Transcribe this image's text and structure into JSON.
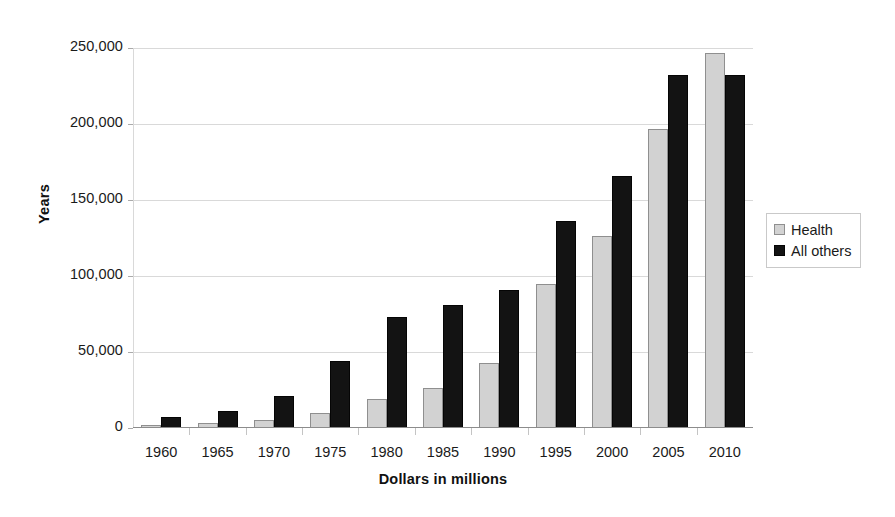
{
  "chart_data": {
    "type": "bar",
    "title": "",
    "xlabel": "Dollars in millions",
    "ylabel": "Years",
    "categories": [
      "1960",
      "1965",
      "1970",
      "1975",
      "1980",
      "1985",
      "1990",
      "1995",
      "2000",
      "2005",
      "2010"
    ],
    "series": [
      {
        "name": "Health",
        "color": "#d2d2d2",
        "values": [
          2000,
          3000,
          5000,
          10000,
          19000,
          26000,
          43000,
          95000,
          126000,
          197000,
          247000
        ]
      },
      {
        "name": "All others",
        "color": "#131313",
        "values": [
          7000,
          11000,
          21000,
          44000,
          73000,
          81000,
          91000,
          136000,
          166000,
          232000,
          232000
        ]
      }
    ],
    "ylim": [
      0,
      250000
    ],
    "ytick_values": [
      0,
      50000,
      100000,
      150000,
      200000,
      250000
    ],
    "ytick_labels": [
      "0",
      "50,000",
      "100,000",
      "150,000",
      "200,000",
      "250,000"
    ],
    "grid": true,
    "legend_position": "right"
  },
  "axes": {
    "y_title": "Years",
    "x_title": "Dollars in millions"
  },
  "legend": {
    "entries": [
      {
        "label": "Health",
        "swatch": "legend-swatch-health"
      },
      {
        "label": "All others",
        "swatch": "legend-swatch-all-others"
      }
    ]
  }
}
